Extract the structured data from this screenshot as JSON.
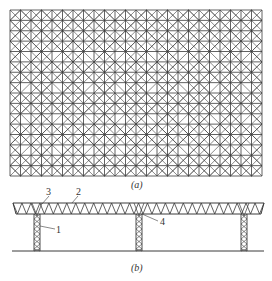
{
  "figure": {
    "panel_a": {
      "caption": "(a)",
      "description": "plan view of space frame grid",
      "grid": {
        "x": 10,
        "y": 10,
        "width": 252,
        "height": 166,
        "cols": 24,
        "rows": 16
      }
    },
    "panel_b": {
      "caption": "(b)",
      "description": "elevation view of truss roof on lattice columns",
      "callouts": [
        {
          "id": "1",
          "label": "1"
        },
        {
          "id": "2",
          "label": "2"
        },
        {
          "id": "3",
          "label": "3"
        },
        {
          "id": "4",
          "label": "4"
        }
      ]
    },
    "colors": {
      "line": "#3a3a3a",
      "background": "#ffffff"
    }
  }
}
